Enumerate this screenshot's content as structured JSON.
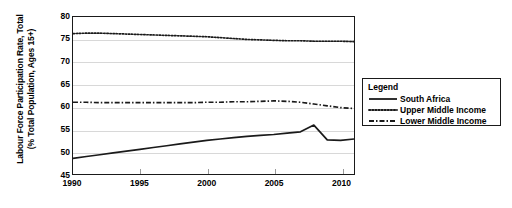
{
  "chart_data": {
    "type": "line",
    "title": "",
    "xlabel": "",
    "ylabel": "Labour Force Participation Rate, Total (% Total Population, Ages 15+)",
    "ylabel_line1": "Labour Force Participation Rate, Total",
    "ylabel_line2": "(% Total Population, Ages 15+)",
    "ylim": [
      45,
      80
    ],
    "ytick_values": [
      45,
      50,
      55,
      60,
      65,
      70,
      75,
      80
    ],
    "ytick_labels": [
      "45",
      "50",
      "55",
      "60",
      "65",
      "70",
      "75",
      "80"
    ],
    "xlim": [
      1990,
      2011
    ],
    "xtick_values": [
      1990,
      1995,
      2000,
      2005,
      2010
    ],
    "xtick_labels": [
      "1990",
      "1995",
      "2000",
      "2005",
      "2010"
    ],
    "grid": "horizontal",
    "legend_position": "right",
    "x": [
      1990,
      1991,
      1992,
      1993,
      1994,
      1995,
      1996,
      1997,
      1998,
      1999,
      2000,
      2001,
      2002,
      2003,
      2004,
      2005,
      2006,
      2007,
      2008,
      2009,
      2010,
      2011
    ],
    "series": [
      {
        "name": "South Africa",
        "style": "solid",
        "color": "#1a1a1a",
        "values": [
          48.5,
          48.9,
          49.3,
          49.7,
          50.1,
          50.5,
          50.9,
          51.3,
          51.7,
          52.1,
          52.5,
          52.8,
          53.1,
          53.4,
          53.6,
          53.8,
          54.1,
          54.4,
          55.9,
          52.6,
          52.5,
          52.8
        ]
      },
      {
        "name": "Upper Middle Income",
        "style": "dotted",
        "color": "#1a1a1a",
        "values": [
          76.3,
          76.4,
          76.4,
          76.3,
          76.2,
          76.1,
          76.0,
          75.9,
          75.8,
          75.7,
          75.6,
          75.4,
          75.2,
          75.0,
          74.9,
          74.8,
          74.7,
          74.7,
          74.6,
          74.6,
          74.6,
          74.5
        ]
      },
      {
        "name": "Lower Middle Income",
        "style": "dashdot",
        "color": "#1a1a1a",
        "values": [
          61.0,
          61.0,
          60.9,
          60.9,
          60.9,
          60.9,
          60.9,
          60.9,
          60.9,
          60.9,
          61.0,
          61.0,
          61.1,
          61.1,
          61.2,
          61.3,
          61.2,
          61.0,
          60.6,
          60.2,
          59.8,
          59.6
        ]
      }
    ]
  },
  "legend": {
    "title": "Legend",
    "items": [
      {
        "label": "South Africa",
        "style": "solid"
      },
      {
        "label": "Upper Middle Income",
        "style": "dotted"
      },
      {
        "label": "Lower Middle Income",
        "style": "dashdot"
      }
    ]
  }
}
